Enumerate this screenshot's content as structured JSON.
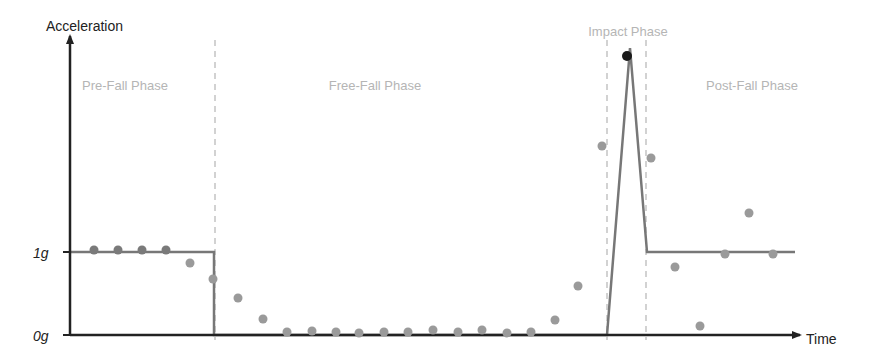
{
  "chart_data": {
    "type": "scatter",
    "title": "",
    "ylabel": "Acceleration",
    "xlabel": "Time",
    "yticks": [
      {
        "label": "0g",
        "y": 335
      },
      {
        "label": "1g",
        "y": 252
      }
    ],
    "phases": [
      {
        "name": "Pre-Fall Phase",
        "label_x": 125,
        "label_y": 90
      },
      {
        "name": "Free-Fall Phase",
        "label_x": 375,
        "label_y": 90
      },
      {
        "name": "Impact Phase",
        "label_x": 628,
        "label_y": 36
      },
      {
        "name": "Post-Fall Phase",
        "label_x": 752,
        "label_y": 90
      }
    ],
    "dividers_x": [
      215,
      607,
      646
    ],
    "model_line": [
      [
        70,
        252
      ],
      [
        214,
        252
      ],
      [
        214,
        335
      ],
      [
        607,
        335
      ],
      [
        630,
        48
      ],
      [
        647,
        252
      ],
      [
        795,
        252
      ]
    ],
    "points": [
      {
        "x": 94,
        "y": 250,
        "shade": "dark"
      },
      {
        "x": 118,
        "y": 250,
        "shade": "dark"
      },
      {
        "x": 142,
        "y": 250,
        "shade": "dark"
      },
      {
        "x": 166,
        "y": 250,
        "shade": "dark"
      },
      {
        "x": 190,
        "y": 263
      },
      {
        "x": 213,
        "y": 279
      },
      {
        "x": 238,
        "y": 298
      },
      {
        "x": 263,
        "y": 319
      },
      {
        "x": 287,
        "y": 332
      },
      {
        "x": 312,
        "y": 331
      },
      {
        "x": 336,
        "y": 332
      },
      {
        "x": 359,
        "y": 333
      },
      {
        "x": 384,
        "y": 332
      },
      {
        "x": 408,
        "y": 332
      },
      {
        "x": 433,
        "y": 330
      },
      {
        "x": 458,
        "y": 332
      },
      {
        "x": 482,
        "y": 330
      },
      {
        "x": 507,
        "y": 333
      },
      {
        "x": 531,
        "y": 332
      },
      {
        "x": 555,
        "y": 320
      },
      {
        "x": 578,
        "y": 286
      },
      {
        "x": 602,
        "y": 146
      },
      {
        "x": 627,
        "y": 56,
        "shade": "black"
      },
      {
        "x": 651,
        "y": 158
      },
      {
        "x": 675,
        "y": 267
      },
      {
        "x": 700,
        "y": 326
      },
      {
        "x": 725,
        "y": 254
      },
      {
        "x": 749,
        "y": 213
      },
      {
        "x": 773,
        "y": 254
      }
    ],
    "colors": {
      "axis": "#222222",
      "model_line": "#777777",
      "point": "#9a9a9a",
      "point_dark": "#7a7a7a",
      "point_peak": "#1a1a1a",
      "divider": "#bbbbbb",
      "phase_label": "#b5b5b5",
      "axis_label": "#222222"
    }
  }
}
